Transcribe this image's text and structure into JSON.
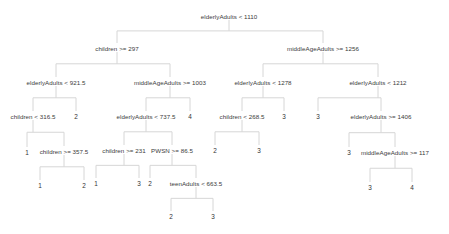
{
  "nodes": [
    {
      "id": "n0",
      "label": "elderlyAdults < 1110",
      "x": 229,
      "y": 16,
      "leaf": false
    },
    {
      "id": "n1",
      "label": "children >= 297",
      "x": 117,
      "y": 48,
      "leaf": false
    },
    {
      "id": "n2",
      "label": "middleAgeAdults >= 1256",
      "x": 323,
      "y": 48,
      "leaf": false
    },
    {
      "id": "n3",
      "label": "elderlyAdults < 921.5",
      "x": 56,
      "y": 82,
      "leaf": false
    },
    {
      "id": "n4",
      "label": "middleAgeAdults >= 1003",
      "x": 170,
      "y": 82,
      "leaf": false
    },
    {
      "id": "n5",
      "label": "elderlyAdults < 1278",
      "x": 263,
      "y": 82,
      "leaf": false
    },
    {
      "id": "n6",
      "label": "elderlyAdults < 1212",
      "x": 378,
      "y": 82,
      "leaf": false
    },
    {
      "id": "n7",
      "label": "children < 316.5",
      "x": 33,
      "y": 116,
      "leaf": false
    },
    {
      "id": "n8",
      "label": "2",
      "x": 76,
      "y": 116,
      "leaf": true
    },
    {
      "id": "n9",
      "label": "elderlyAdults < 737.5",
      "x": 146,
      "y": 116,
      "leaf": false
    },
    {
      "id": "n10",
      "label": "4",
      "x": 190,
      "y": 116,
      "leaf": true
    },
    {
      "id": "n11",
      "label": "children < 268.5",
      "x": 242,
      "y": 116,
      "leaf": false
    },
    {
      "id": "n12",
      "label": "3",
      "x": 284,
      "y": 116,
      "leaf": true
    },
    {
      "id": "n13",
      "label": "3",
      "x": 318,
      "y": 116,
      "leaf": true
    },
    {
      "id": "n14",
      "label": "elderlyAdults >= 1406",
      "x": 381,
      "y": 116,
      "leaf": false
    },
    {
      "id": "n15",
      "label": "1",
      "x": 27,
      "y": 152,
      "leaf": true
    },
    {
      "id": "n16",
      "label": "children >= 357.5",
      "x": 64,
      "y": 151,
      "leaf": false
    },
    {
      "id": "n17",
      "label": "children >= 231",
      "x": 124,
      "y": 150,
      "leaf": false
    },
    {
      "id": "n18",
      "label": "PWSN >= 86.5",
      "x": 172,
      "y": 150,
      "leaf": false
    },
    {
      "id": "n19",
      "label": "2",
      "x": 215,
      "y": 150,
      "leaf": true
    },
    {
      "id": "n20",
      "label": "3",
      "x": 259,
      "y": 150,
      "leaf": true
    },
    {
      "id": "n21",
      "label": "3",
      "x": 349,
      "y": 152,
      "leaf": true
    },
    {
      "id": "n22",
      "label": "middleAgeAdults >= 117",
      "x": 395,
      "y": 152,
      "leaf": false
    },
    {
      "id": "n23",
      "label": "1",
      "x": 40,
      "y": 185,
      "leaf": true
    },
    {
      "id": "n24",
      "label": "2",
      "x": 84,
      "y": 185,
      "leaf": true
    },
    {
      "id": "n25",
      "label": "1",
      "x": 96,
      "y": 183,
      "leaf": true
    },
    {
      "id": "n26",
      "label": "3",
      "x": 139,
      "y": 183,
      "leaf": true
    },
    {
      "id": "n27",
      "label": "2",
      "x": 150,
      "y": 183,
      "leaf": true
    },
    {
      "id": "n28",
      "label": "teenAdults < 663.5",
      "x": 196,
      "y": 183,
      "leaf": false
    },
    {
      "id": "n29",
      "label": "3",
      "x": 370,
      "y": 187,
      "leaf": true
    },
    {
      "id": "n30",
      "label": "4",
      "x": 412,
      "y": 187,
      "leaf": true
    },
    {
      "id": "n31",
      "label": "2",
      "x": 171,
      "y": 216,
      "leaf": true
    },
    {
      "id": "n32",
      "label": "3",
      "x": 213,
      "y": 216,
      "leaf": true
    }
  ],
  "edges": [
    [
      "n0",
      "n1"
    ],
    [
      "n0",
      "n2"
    ],
    [
      "n1",
      "n3"
    ],
    [
      "n1",
      "n4"
    ],
    [
      "n2",
      "n5"
    ],
    [
      "n2",
      "n6"
    ],
    [
      "n3",
      "n7"
    ],
    [
      "n3",
      "n8"
    ],
    [
      "n4",
      "n9"
    ],
    [
      "n4",
      "n10"
    ],
    [
      "n5",
      "n11"
    ],
    [
      "n5",
      "n12"
    ],
    [
      "n6",
      "n13"
    ],
    [
      "n6",
      "n14"
    ],
    [
      "n7",
      "n15"
    ],
    [
      "n7",
      "n16"
    ],
    [
      "n9",
      "n17"
    ],
    [
      "n9",
      "n18"
    ],
    [
      "n11",
      "n19"
    ],
    [
      "n11",
      "n20"
    ],
    [
      "n14",
      "n21"
    ],
    [
      "n14",
      "n22"
    ],
    [
      "n16",
      "n23"
    ],
    [
      "n16",
      "n24"
    ],
    [
      "n17",
      "n25"
    ],
    [
      "n17",
      "n26"
    ],
    [
      "n18",
      "n27"
    ],
    [
      "n18",
      "n28"
    ],
    [
      "n22",
      "n29"
    ],
    [
      "n22",
      "n30"
    ],
    [
      "n28",
      "n31"
    ],
    [
      "n28",
      "n32"
    ]
  ]
}
